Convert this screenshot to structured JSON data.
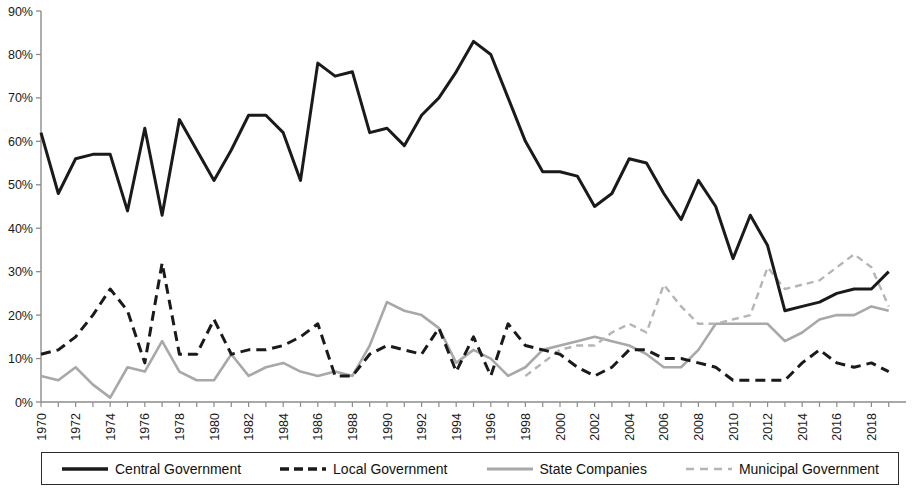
{
  "chart_data": {
    "type": "line",
    "title": "",
    "xlabel": "",
    "ylabel": "",
    "ylim": [
      0,
      90
    ],
    "ytick_values": [
      0,
      10,
      20,
      30,
      40,
      50,
      60,
      70,
      80,
      90
    ],
    "ytick_labels": [
      "0%",
      "10%",
      "20%",
      "30%",
      "40%",
      "50%",
      "60%",
      "70%",
      "80%",
      "90%"
    ],
    "xlim": [
      1970,
      2019
    ],
    "x": [
      1970,
      1971,
      1972,
      1973,
      1974,
      1975,
      1976,
      1977,
      1978,
      1979,
      1980,
      1981,
      1982,
      1983,
      1984,
      1985,
      1986,
      1987,
      1988,
      1989,
      1990,
      1991,
      1992,
      1993,
      1994,
      1995,
      1996,
      1997,
      1998,
      1999,
      2000,
      2001,
      2002,
      2003,
      2004,
      2005,
      2006,
      2007,
      2008,
      2009,
      2010,
      2011,
      2012,
      2013,
      2014,
      2015,
      2016,
      2017,
      2018,
      2019
    ],
    "xtick_labels": [
      "1970",
      "1972",
      "1974",
      "1976",
      "1978",
      "1980",
      "1982",
      "1984",
      "1986",
      "1988",
      "1990",
      "1992",
      "1994",
      "1996",
      "1998",
      "2000",
      "2002",
      "2004",
      "2006",
      "2008",
      "2010",
      "2012",
      "2014",
      "2016",
      "2018"
    ],
    "xtick_values": [
      1970,
      1972,
      1974,
      1976,
      1978,
      1980,
      1982,
      1984,
      1986,
      1988,
      1990,
      1992,
      1994,
      1996,
      1998,
      2000,
      2002,
      2004,
      2006,
      2008,
      2010,
      2012,
      2014,
      2016,
      2018
    ],
    "grid": false,
    "legend_position": "bottom",
    "series": [
      {
        "name": "Central Government",
        "color": "#1a1a1a",
        "style": "solid",
        "width": 3.0,
        "values": [
          62,
          48,
          56,
          57,
          57,
          44,
          63,
          43,
          65,
          58,
          51,
          58,
          66,
          66,
          62,
          51,
          78,
          75,
          76,
          62,
          63,
          59,
          66,
          70,
          76,
          83,
          80,
          70,
          60,
          53,
          53,
          52,
          45,
          48,
          56,
          55,
          48,
          42,
          51,
          45,
          33,
          43,
          36,
          21,
          22,
          23,
          25,
          26,
          26,
          30
        ]
      },
      {
        "name": "Local Government",
        "color": "#1a1a1a",
        "style": "dashed",
        "width": 3.0,
        "values": [
          11,
          12,
          15,
          20,
          26,
          21,
          9,
          32,
          11,
          11,
          19,
          11,
          12,
          12,
          13,
          15,
          18,
          6,
          6,
          11,
          13,
          12,
          11,
          17,
          7,
          15,
          6,
          18,
          13,
          12,
          11,
          8,
          6,
          8,
          12,
          12,
          10,
          10,
          9,
          8,
          5,
          5,
          5,
          5,
          9,
          12,
          9,
          8,
          9,
          7
        ]
      },
      {
        "name": "State Companies",
        "color": "#a8a8a8",
        "style": "solid",
        "width": 2.6,
        "values": [
          6,
          5,
          8,
          4,
          1,
          8,
          7,
          14,
          7,
          5,
          5,
          11,
          6,
          8,
          9,
          7,
          6,
          7,
          6,
          13,
          23,
          21,
          20,
          17,
          9,
          12,
          10,
          6,
          8,
          12,
          13,
          14,
          15,
          14,
          13,
          11,
          8,
          8,
          12,
          18,
          18,
          18,
          18,
          14,
          16,
          19,
          20,
          20,
          22,
          21
        ]
      },
      {
        "name": "Municipal Government",
        "color": "#b5b5b5",
        "style": "dashed",
        "width": 2.4,
        "values": [
          null,
          null,
          null,
          null,
          null,
          null,
          null,
          null,
          null,
          null,
          null,
          null,
          null,
          null,
          null,
          null,
          null,
          null,
          null,
          null,
          null,
          null,
          null,
          null,
          null,
          null,
          null,
          null,
          6,
          9,
          12,
          13,
          13,
          16,
          18,
          16,
          27,
          22,
          18,
          18,
          19,
          20,
          31,
          26,
          27,
          28,
          31,
          34,
          31,
          22
        ]
      }
    ]
  },
  "legend": {
    "items": [
      {
        "label": "Central Government",
        "swatch": "solid-black"
      },
      {
        "label": "Local Government",
        "swatch": "dashed-black"
      },
      {
        "label": "State Companies",
        "swatch": "solid-gray"
      },
      {
        "label": "Municipal Government",
        "swatch": "dashed-gray"
      }
    ]
  }
}
